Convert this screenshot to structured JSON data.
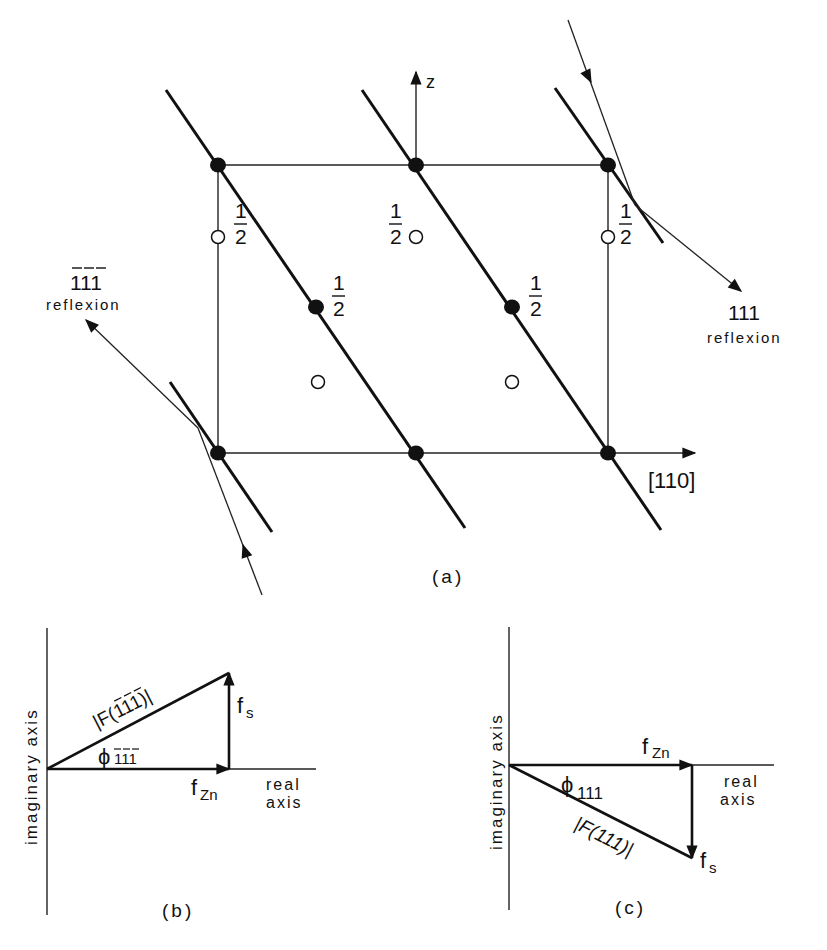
{
  "panel_a": {
    "label": "(a)",
    "axis_z_label": "z",
    "axis_x_label": "[110]",
    "half_label_num": "1",
    "half_label_den": "2",
    "reflexion_left": {
      "index": "111",
      "index_overbar": true,
      "text": "reflexion"
    },
    "reflexion_right": {
      "index": "111",
      "index_overbar": false,
      "text": "reflexion"
    },
    "atoms_filled": [
      {
        "x": 218,
        "y": 165
      },
      {
        "x": 416,
        "y": 165
      },
      {
        "x": 608,
        "y": 165
      },
      {
        "x": 316,
        "y": 307,
        "label": "1/2"
      },
      {
        "x": 512,
        "y": 307,
        "label": "1/2"
      },
      {
        "x": 218,
        "y": 453
      },
      {
        "x": 416,
        "y": 453
      },
      {
        "x": 608,
        "y": 453
      }
    ],
    "atoms_open": [
      {
        "x": 211,
        "y": 237,
        "label": "1/2"
      },
      {
        "x": 416,
        "y": 237,
        "label": "1/2"
      },
      {
        "x": 608,
        "y": 237,
        "label": "1/2"
      },
      {
        "x": 318,
        "y": 382
      },
      {
        "x": 512,
        "y": 382
      }
    ]
  },
  "panel_b": {
    "label": "(b)",
    "y_axis_label": "imaginary axis",
    "x_axis_label_line1": "real",
    "x_axis_label_line2": "axis",
    "f_zn": "f",
    "f_zn_sub": "Zn",
    "f_s": "f",
    "f_s_sub": "s",
    "magnitude_label": "|F(111)|",
    "magnitude_overbar": true,
    "phase_symbol": "ϕ",
    "phase_sub": "111",
    "phase_sub_overbar": true
  },
  "panel_c": {
    "label": "(c)",
    "y_axis_label": "imaginary axis",
    "x_axis_label_line1": "real",
    "x_axis_label_line2": "axis",
    "f_zn": "f",
    "f_zn_sub": "Zn",
    "f_s": "f",
    "f_s_sub": "s",
    "magnitude_label": "|F(111)|",
    "magnitude_overbar": false,
    "phase_symbol": "ϕ",
    "phase_sub": "111",
    "phase_sub_overbar": false
  }
}
